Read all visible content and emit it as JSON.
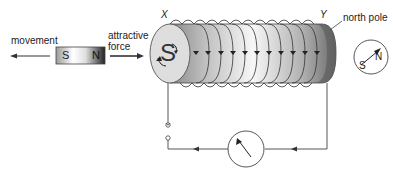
{
  "labels": {
    "movement": "movement",
    "attractive_line1": "attractive",
    "attractive_line2": "force",
    "end_x": "X",
    "end_y": "Y",
    "north_pole": "north pole",
    "coil_pole_letter": "S",
    "magnet_south": "S",
    "magnet_north": "N",
    "compass_south": "S",
    "compass_north": "N"
  },
  "colors": {
    "line": "#333333",
    "coil_dark": "#6e6e6e",
    "coil_light": "#f4f4f4",
    "end_face": "#dcdcdc"
  },
  "components": [
    "bar magnet",
    "solenoid coil",
    "galvanometer",
    "switch",
    "compass"
  ]
}
